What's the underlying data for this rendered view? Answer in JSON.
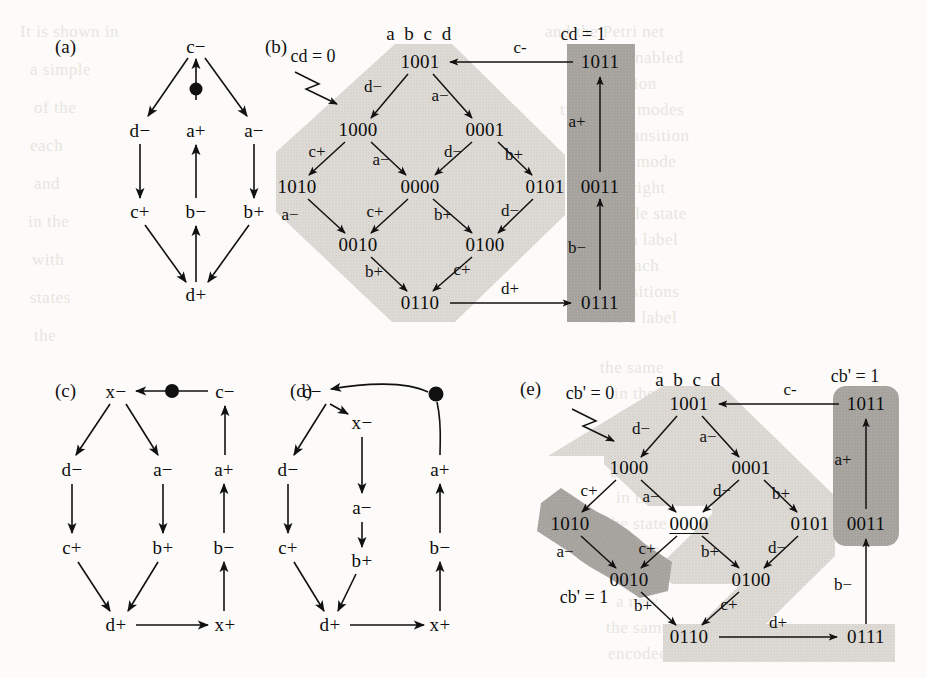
{
  "figure": {
    "background": "#fcfbf9",
    "shade_light": "#dedbd6",
    "shade_dark": "#aaa7a3",
    "ink": "#111111"
  },
  "panels": [
    {
      "id": "a",
      "label": "(a)"
    },
    {
      "id": "b",
      "label": "(b)"
    },
    {
      "id": "c",
      "label": "(c)"
    },
    {
      "id": "d",
      "label": "(d)"
    },
    {
      "id": "e",
      "label": "(e)"
    }
  ],
  "panel_a": {
    "label": "(a)",
    "nodes": [
      {
        "id": "c-",
        "text": "c−",
        "x": 196,
        "y": 47
      },
      {
        "id": "d-",
        "text": "d−",
        "x": 140,
        "y": 131
      },
      {
        "id": "a+",
        "text": "a+",
        "x": 196,
        "y": 131
      },
      {
        "id": "a-",
        "text": "a−",
        "x": 254,
        "y": 131
      },
      {
        "id": "c+",
        "text": "c+",
        "x": 140,
        "y": 212
      },
      {
        "id": "b-",
        "text": "b−",
        "x": 196,
        "y": 212
      },
      {
        "id": "b+",
        "text": "b+",
        "x": 254,
        "y": 212
      },
      {
        "id": "d+",
        "text": "d+",
        "x": 196,
        "y": 295
      }
    ],
    "token": {
      "x": 196,
      "y": 89,
      "r": 6
    }
  },
  "panel_b": {
    "label": "(b)",
    "header": "a b c d",
    "header_pos": {
      "x": 420,
      "y": 34
    },
    "caption_left": "cd = 0",
    "caption_left_pos": {
      "x": 313,
      "y": 56
    },
    "caption_right": "cd = 1",
    "caption_right_pos": {
      "x": 583,
      "y": 34
    },
    "nodes": [
      {
        "id": "1001",
        "text": "1001",
        "x": 420,
        "y": 62
      },
      {
        "id": "1000",
        "text": "1000",
        "x": 358,
        "y": 130
      },
      {
        "id": "0001",
        "text": "0001",
        "x": 485,
        "y": 130
      },
      {
        "id": "1010",
        "text": "1010",
        "x": 297,
        "y": 187
      },
      {
        "id": "0000",
        "text": "0000",
        "x": 420,
        "y": 187
      },
      {
        "id": "0101",
        "text": "0101",
        "x": 545,
        "y": 187
      },
      {
        "id": "0010",
        "text": "0010",
        "x": 358,
        "y": 245
      },
      {
        "id": "0100",
        "text": "0100",
        "x": 485,
        "y": 245
      },
      {
        "id": "0110",
        "text": "0110",
        "x": 420,
        "y": 303
      },
      {
        "id": "1011",
        "text": "1011",
        "x": 600,
        "y": 62
      },
      {
        "id": "0011",
        "text": "0011",
        "x": 600,
        "y": 187
      },
      {
        "id": "0111",
        "text": "0111",
        "x": 600,
        "y": 303
      }
    ],
    "edge_labels": [
      {
        "text": "d−",
        "x": 373,
        "y": 87
      },
      {
        "text": "a−",
        "x": 440,
        "y": 96
      },
      {
        "text": "c+",
        "x": 317,
        "y": 152
      },
      {
        "text": "a−",
        "x": 381,
        "y": 160
      },
      {
        "text": "d−",
        "x": 453,
        "y": 152
      },
      {
        "text": "b+",
        "x": 514,
        "y": 155
      },
      {
        "text": "a−",
        "x": 290,
        "y": 215
      },
      {
        "text": "c+",
        "x": 375,
        "y": 212
      },
      {
        "text": "b+",
        "x": 443,
        "y": 215
      },
      {
        "text": "d−",
        "x": 510,
        "y": 211
      },
      {
        "text": "b+",
        "x": 374,
        "y": 272
      },
      {
        "text": "c+",
        "x": 462,
        "y": 270
      },
      {
        "text": "c-",
        "x": 520,
        "y": 48
      },
      {
        "text": "d+",
        "x": 510,
        "y": 289
      },
      {
        "text": "a+",
        "x": 577,
        "y": 122
      },
      {
        "text": "b−",
        "x": 577,
        "y": 248
      }
    ]
  },
  "panel_c": {
    "label": "(c)",
    "nodes": [
      {
        "id": "x-",
        "text": "x−",
        "x": 116,
        "y": 392
      },
      {
        "id": "c-",
        "text": "c−",
        "x": 225,
        "y": 392
      },
      {
        "id": "d-",
        "text": "d−",
        "x": 72,
        "y": 470
      },
      {
        "id": "a-",
        "text": "a−",
        "x": 163,
        "y": 470
      },
      {
        "id": "a+",
        "text": "a+",
        "x": 224,
        "y": 470
      },
      {
        "id": "c+",
        "text": "c+",
        "x": 72,
        "y": 548
      },
      {
        "id": "b+",
        "text": "b+",
        "x": 163,
        "y": 548
      },
      {
        "id": "b-",
        "text": "b−",
        "x": 224,
        "y": 548
      },
      {
        "id": "d+",
        "text": "d+",
        "x": 116,
        "y": 625
      },
      {
        "id": "x+",
        "text": "x+",
        "x": 225,
        "y": 625
      }
    ],
    "token": {
      "x": 172,
      "y": 391,
      "r": 6.5
    }
  },
  "panel_d": {
    "label": "(d)",
    "nodes": [
      {
        "id": "c-",
        "text": "c−",
        "x": 312,
        "y": 392
      },
      {
        "id": "x-",
        "text": "x−",
        "x": 362,
        "y": 423
      },
      {
        "id": "d-",
        "text": "d−",
        "x": 288,
        "y": 470
      },
      {
        "id": "a+",
        "text": "a+",
        "x": 440,
        "y": 470
      },
      {
        "id": "a-",
        "text": "a−",
        "x": 362,
        "y": 508
      },
      {
        "id": "c+",
        "text": "c+",
        "x": 288,
        "y": 548
      },
      {
        "id": "b+",
        "text": "b+",
        "x": 362,
        "y": 561
      },
      {
        "id": "b-",
        "text": "b−",
        "x": 440,
        "y": 548
      },
      {
        "id": "d+",
        "text": "d+",
        "x": 330,
        "y": 625
      },
      {
        "id": "x+",
        "text": "x+",
        "x": 440,
        "y": 625
      }
    ],
    "token": {
      "x": 436,
      "y": 394,
      "r": 6.5
    }
  },
  "panel_e": {
    "label": "(e)",
    "header": "a b c d",
    "header_pos": {
      "x": 689,
      "y": 380
    },
    "caption_left_top": "cb' = 0",
    "caption_left_top_pos": {
      "x": 590,
      "y": 393
    },
    "caption_left_bottom": "cb' = 1",
    "caption_left_bottom_pos": {
      "x": 584,
      "y": 597
    },
    "caption_right": "cb' = 1",
    "caption_right_pos": {
      "x": 855,
      "y": 376
    },
    "nodes": [
      {
        "id": "1001",
        "text": "1001",
        "x": 689,
        "y": 404,
        "underline": false
      },
      {
        "id": "1000",
        "text": "1000",
        "x": 629,
        "y": 468,
        "underline": false
      },
      {
        "id": "0001",
        "text": "0001",
        "x": 751,
        "y": 468,
        "underline": false
      },
      {
        "id": "1010",
        "text": "1010",
        "x": 570,
        "y": 524,
        "underline": false
      },
      {
        "id": "0000",
        "text": "0000",
        "x": 689,
        "y": 524,
        "underline": true
      },
      {
        "id": "0101",
        "text": "0101",
        "x": 810,
        "y": 524,
        "underline": false
      },
      {
        "id": "0010",
        "text": "0010",
        "x": 629,
        "y": 580,
        "underline": false
      },
      {
        "id": "0100",
        "text": "0100",
        "x": 751,
        "y": 580,
        "underline": false
      },
      {
        "id": "0110",
        "text": "0110",
        "x": 689,
        "y": 637,
        "underline": false
      },
      {
        "id": "1011",
        "text": "1011",
        "x": 866,
        "y": 404,
        "underline": false
      },
      {
        "id": "0011",
        "text": "0011",
        "x": 866,
        "y": 524,
        "underline": false
      },
      {
        "id": "0111",
        "text": "0111",
        "x": 866,
        "y": 637,
        "underline": false
      }
    ],
    "edge_labels": [
      {
        "text": "d−",
        "x": 641,
        "y": 429
      },
      {
        "text": "a−",
        "x": 708,
        "y": 437
      },
      {
        "text": "c+",
        "x": 589,
        "y": 491
      },
      {
        "text": "a−",
        "x": 651,
        "y": 497
      },
      {
        "text": "d−",
        "x": 722,
        "y": 491
      },
      {
        "text": "b+",
        "x": 781,
        "y": 494
      },
      {
        "text": "a−",
        "x": 565,
        "y": 552
      },
      {
        "text": "c+",
        "x": 647,
        "y": 549
      },
      {
        "text": "b+",
        "x": 710,
        "y": 552
      },
      {
        "text": "d−",
        "x": 777,
        "y": 548
      },
      {
        "text": "b+",
        "x": 643,
        "y": 606
      },
      {
        "text": "c+",
        "x": 729,
        "y": 605
      },
      {
        "text": "c-",
        "x": 790,
        "y": 390
      },
      {
        "text": "d+",
        "x": 778,
        "y": 623
      },
      {
        "text": "a+",
        "x": 843,
        "y": 460
      },
      {
        "text": "b−",
        "x": 843,
        "y": 585
      }
    ]
  },
  "ghost_text": [
    {
      "t": "and the Petri net",
      "x": 545,
      "y": 22
    },
    {
      "t": "the enabled",
      "x": 600,
      "y": 48
    },
    {
      "t": "condition",
      "x": 588,
      "y": 74
    },
    {
      "t": "two firing modes",
      "x": 560,
      "y": 100
    },
    {
      "t": "signal transition",
      "x": 572,
      "y": 126
    },
    {
      "t": "in some mode",
      "x": 575,
      "y": 152
    },
    {
      "t": "the right",
      "x": 604,
      "y": 178
    },
    {
      "t": "a reachable state",
      "x": 566,
      "y": 204
    },
    {
      "t": "with a label",
      "x": 593,
      "y": 230
    },
    {
      "t": "for each",
      "x": 600,
      "y": 256
    },
    {
      "t": "the transitions",
      "x": 576,
      "y": 282
    },
    {
      "t": "and a label",
      "x": 598,
      "y": 308
    },
    {
      "t": "the same",
      "x": 600,
      "y": 358
    },
    {
      "t": "in the",
      "x": 614,
      "y": 384
    },
    {
      "t": "can be",
      "x": 612,
      "y": 410
    },
    {
      "t": "that",
      "x": 622,
      "y": 436
    },
    {
      "t": "obtained",
      "x": 610,
      "y": 462
    },
    {
      "t": "in the",
      "x": 616,
      "y": 488
    },
    {
      "t": "the state",
      "x": 606,
      "y": 514
    },
    {
      "t": "is then",
      "x": 612,
      "y": 540
    },
    {
      "t": "with",
      "x": 620,
      "y": 566
    },
    {
      "t": "a new",
      "x": 616,
      "y": 592
    },
    {
      "t": "the same",
      "x": 606,
      "y": 618
    },
    {
      "t": "encoded",
      "x": 608,
      "y": 644
    },
    {
      "t": "It is shown in",
      "x": 20,
      "y": 22
    },
    {
      "t": "a simple",
      "x": 30,
      "y": 60
    },
    {
      "t": "of the",
      "x": 34,
      "y": 98
    },
    {
      "t": "each",
      "x": 30,
      "y": 136
    },
    {
      "t": "and",
      "x": 34,
      "y": 174
    },
    {
      "t": "in the",
      "x": 28,
      "y": 212
    },
    {
      "t": "with",
      "x": 32,
      "y": 250
    },
    {
      "t": "states",
      "x": 30,
      "y": 288
    },
    {
      "t": "the",
      "x": 34,
      "y": 326
    }
  ]
}
